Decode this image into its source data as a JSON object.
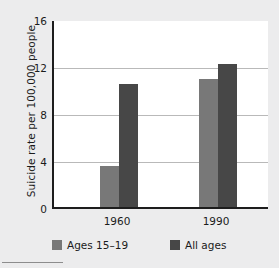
{
  "chart_data": {
    "type": "bar",
    "title": "",
    "xlabel": "",
    "ylabel": "Suicide rate per 100,000 people",
    "categories": [
      "1960",
      "1990"
    ],
    "series": [
      {
        "name": "Ages 15–19",
        "values": [
          3.5,
          11.0
        ],
        "color": "#787878"
      },
      {
        "name": "All ages",
        "values": [
          10.6,
          12.3
        ],
        "color": "#474747"
      }
    ],
    "ylim": [
      0,
      16
    ],
    "yticks": [
      0,
      4,
      8,
      12,
      16
    ],
    "ytick_labels": [
      "0",
      "4",
      "8",
      "12",
      "16"
    ],
    "xtick_labels": [
      "1960",
      "1990"
    ],
    "grid": "horizontal",
    "legend_position": "below"
  },
  "figure": {
    "background_color": "#ececed",
    "plot_background_color": "#ffffff",
    "axis_color": "#1d1d1d",
    "gridline_color": "#b9b9b9"
  }
}
